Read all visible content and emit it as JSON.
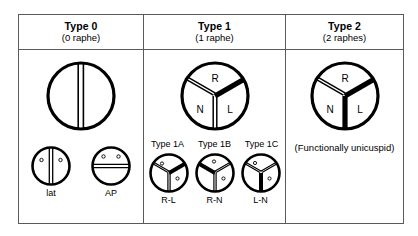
{
  "figure": {
    "columns": [
      {
        "id": "type-0",
        "title": "Type 0",
        "subtitle": "(0 raphe)",
        "raphe_count": 0,
        "main_diagram": "two-cusp valve, single straight commissure, no raphe",
        "variants": [
          {
            "id": "lat",
            "label": "lat",
            "orientation": "lateral",
            "commissure": "vertical"
          },
          {
            "id": "ap",
            "label": "AP",
            "orientation": "anterior-posterior",
            "commissure": "horizontal"
          }
        ]
      },
      {
        "id": "type-1",
        "title": "Type 1",
        "subtitle": "(1 raphe)",
        "raphe_count": 1,
        "cusps": [
          "R",
          "N",
          "L"
        ],
        "main_diagram": "three sinuses with one fused raphe between R and L",
        "variant_headers": [
          "Type 1A",
          "Type 1B",
          "Type 1C"
        ],
        "variants": [
          {
            "id": "1a",
            "header": "Type 1A",
            "label": "R-L",
            "fused": "R-L",
            "raphe_position": "upper-right"
          },
          {
            "id": "1b",
            "header": "Type 1B",
            "label": "R-N",
            "fused": "R-N",
            "raphe_position": "upper-left"
          },
          {
            "id": "1c",
            "header": "Type 1C",
            "label": "L-N",
            "fused": "L-N",
            "raphe_position": "bottom"
          }
        ]
      },
      {
        "id": "type-2",
        "title": "Type 2",
        "subtitle": "(2 raphes)",
        "raphe_count": 2,
        "cusps": [
          "R",
          "N",
          "L"
        ],
        "main_diagram": "three sinuses with two fused raphes",
        "note": "(Functionally unicuspid)",
        "variants": []
      }
    ],
    "cusp_labels": {
      "r": "R",
      "n": "N",
      "l": "L"
    },
    "colors": {
      "raphe": "#000000",
      "outline": "#000000",
      "frame": "#5a5a5a",
      "background": "#ffffff"
    }
  }
}
